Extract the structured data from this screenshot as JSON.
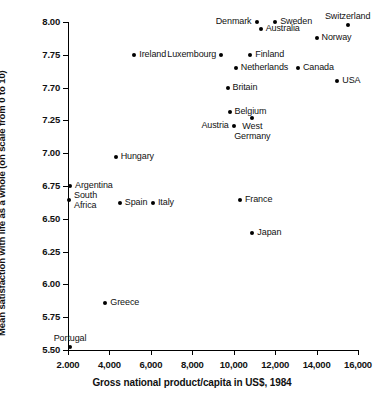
{
  "chart_data": {
    "type": "scatter",
    "title": "",
    "xlabel": "Gross national product/capita in US$, 1984",
    "ylabel": "Mean satisfaction with life as a whole (on scale from 0 to 10)",
    "xlim": [
      2000,
      16000
    ],
    "ylim": [
      5.5,
      8.0
    ],
    "grid": false,
    "legend": "none",
    "x_tick_labels": [
      "2.000",
      "4,000",
      "6,000",
      "8,000",
      "10,000",
      "12,000",
      "14,000",
      "16,000"
    ],
    "x_tick_values": [
      2000,
      4000,
      6000,
      8000,
      10000,
      12000,
      14000,
      16000
    ],
    "y_tick_labels": [
      "8.00",
      "7.75",
      "7.70",
      "7.25",
      "7.00",
      "6.75",
      "6.50",
      "6.25",
      "6.00",
      "5.75",
      "5.50"
    ],
    "y_tick_values": [
      8.0,
      7.75,
      7.7,
      7.25,
      7.0,
      6.75,
      6.5,
      6.25,
      6.0,
      5.75,
      5.5
    ],
    "note_on_axis": "Y tick labels are evenly spaced as printed; the 3rd label reads 7.70 in the source image where 7.50 would be expected.",
    "points": [
      {
        "name": "Denmark",
        "x": 11100,
        "y": 8.0,
        "label_pos": "left"
      },
      {
        "name": "Sweden",
        "x": 12000,
        "y": 8.0,
        "label_pos": "right"
      },
      {
        "name": "Switzerland",
        "x": 15500,
        "y": 7.98,
        "label_pos": "above"
      },
      {
        "name": "Australia",
        "x": 11300,
        "y": 7.95,
        "label_pos": "right"
      },
      {
        "name": "Norway",
        "x": 14000,
        "y": 7.88,
        "label_pos": "right"
      },
      {
        "name": "Ireland",
        "x": 5200,
        "y": 7.75,
        "label_pos": "right"
      },
      {
        "name": "Luxembourg",
        "x": 9400,
        "y": 7.75,
        "label_pos": "left"
      },
      {
        "name": "Finland",
        "x": 10800,
        "y": 7.75,
        "label_pos": "right"
      },
      {
        "name": "Netherlands",
        "x": 10100,
        "y": 7.73,
        "label_pos": "right"
      },
      {
        "name": "Canada",
        "x": 13100,
        "y": 7.73,
        "label_pos": "right"
      },
      {
        "name": "USA",
        "x": 15000,
        "y": 7.71,
        "label_pos": "right"
      },
      {
        "name": "Britain",
        "x": 9700,
        "y": 7.7,
        "label_pos": "right"
      },
      {
        "name": "Belgium",
        "x": 9800,
        "y": 7.37,
        "label_pos": "right"
      },
      {
        "name": "West Germany",
        "x": 10900,
        "y": 7.28,
        "label_pos": "below"
      },
      {
        "name": "Austria",
        "x": 10000,
        "y": 7.21,
        "label_pos": "left"
      },
      {
        "name": "Hungary",
        "x": 4300,
        "y": 6.97,
        "label_pos": "right"
      },
      {
        "name": "Argentina",
        "x": 2100,
        "y": 6.75,
        "label_pos": "right"
      },
      {
        "name": "South Africa",
        "x": 2050,
        "y": 6.64,
        "label_pos": "right"
      },
      {
        "name": "Spain",
        "x": 4500,
        "y": 6.62,
        "label_pos": "right"
      },
      {
        "name": "Italy",
        "x": 6100,
        "y": 6.62,
        "label_pos": "right"
      },
      {
        "name": "France",
        "x": 10300,
        "y": 6.64,
        "label_pos": "right"
      },
      {
        "name": "Japan",
        "x": 10900,
        "y": 6.39,
        "label_pos": "right"
      },
      {
        "name": "Greece",
        "x": 3800,
        "y": 5.86,
        "label_pos": "right"
      },
      {
        "name": "Portugal",
        "x": 2100,
        "y": 5.52,
        "label_pos": "above"
      }
    ]
  }
}
